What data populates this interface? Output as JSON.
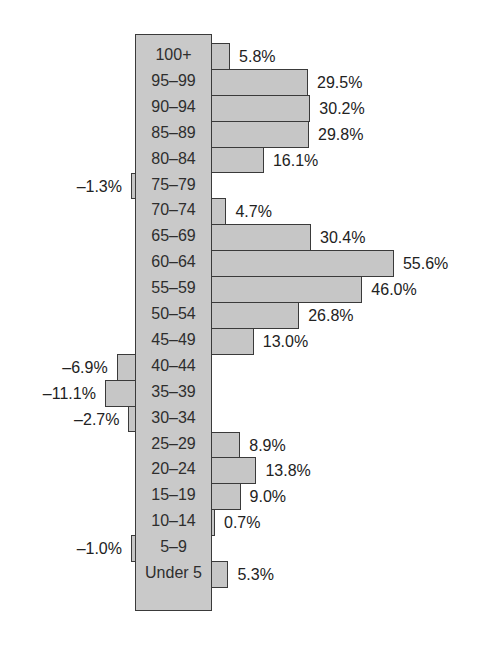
{
  "chart_data": {
    "type": "bar",
    "orientation": "horizontal",
    "title": "",
    "xlabel": "",
    "ylabel": "",
    "grid": false,
    "legend": null,
    "categories": [
      "100+",
      "95–99",
      "90–94",
      "85–89",
      "80–84",
      "75–79",
      "70–74",
      "65–69",
      "60–64",
      "55–59",
      "50–54",
      "45–49",
      "40–44",
      "35–39",
      "30–34",
      "25–29",
      "20–24",
      "15–19",
      "10–14",
      "5–9",
      "Under 5"
    ],
    "values": [
      5.8,
      29.5,
      30.2,
      29.8,
      16.1,
      -1.3,
      4.7,
      30.4,
      55.6,
      46.0,
      26.8,
      13.0,
      -6.9,
      -11.1,
      -2.7,
      8.9,
      13.8,
      9.0,
      0.7,
      -1.0,
      5.3
    ],
    "value_labels": [
      "5.8%",
      "29.5%",
      "30.2%",
      "29.8%",
      "16.1%",
      "–1.3%",
      "4.7%",
      "30.4%",
      "55.6%",
      "46.0%",
      "26.8%",
      "13.0%",
      "–6.9%",
      "–11.1%",
      "–2.7%",
      "8.9%",
      "13.8%",
      "9.0%",
      "0.7%",
      "–1.0%",
      "5.3%"
    ],
    "unit": "%"
  },
  "style": {
    "bar_fill": "#c6c6c6",
    "bar_stroke": "#3a3a3a",
    "label_box_fill": "#c9c9c9",
    "text_color": "#2a2a2a"
  }
}
